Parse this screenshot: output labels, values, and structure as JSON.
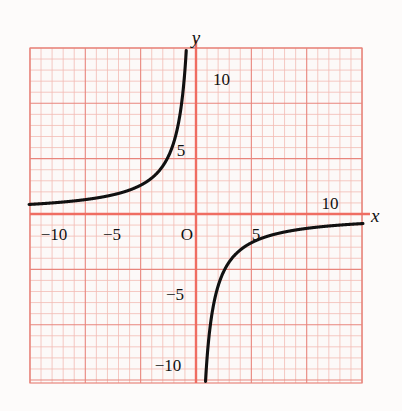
{
  "figure": {
    "background_color": "#fdfbfa",
    "plot_background_color": "#fcf9f8",
    "grid_color_minor": "#f0b5ae",
    "grid_color_major": "#e8857c",
    "axis_color": "#ef6d62",
    "curve_color": "#111111",
    "label_color": "#111111"
  },
  "axes": {
    "x_label": "x",
    "y_label": "y",
    "origin_label": "O"
  },
  "x_ticks": [
    {
      "value": -10,
      "label": "−10"
    },
    {
      "value": -5,
      "label": "−5"
    },
    {
      "value": 5,
      "label": "5"
    },
    {
      "value": 10,
      "label": "10"
    }
  ],
  "y_ticks": [
    {
      "value": 10,
      "label": "10"
    },
    {
      "value": 5,
      "label": "5"
    },
    {
      "value": -5,
      "label": "−5"
    },
    {
      "value": -10,
      "label": "−10"
    }
  ],
  "chart_data": {
    "type": "line",
    "title": "",
    "xlabel": "x",
    "ylabel": "y",
    "xlim": [
      -15,
      15
    ],
    "ylim": [
      -15.1,
      15
    ],
    "grid": true,
    "grid_minor_step": 1,
    "grid_major_step": 5,
    "legend": "none",
    "equation": "y = -13/x",
    "asymptotes": {
      "vertical": 0,
      "horizontal": 0
    },
    "series": [
      {
        "name": "y = -13/x (branch in quadrant II)",
        "x": [
          -15,
          -14,
          -13,
          -12,
          -11,
          -10,
          -9,
          -8,
          -7,
          -6,
          -5,
          -4.5,
          -4,
          -3.5,
          -3,
          -2.75,
          -2.5,
          -2.25,
          -2,
          -1.8,
          -1.6,
          -1.4,
          -1.3,
          -1.2,
          -1.1,
          -1.0,
          -0.95,
          -0.9
        ],
        "y": [
          0.867,
          0.929,
          1.0,
          1.083,
          1.182,
          1.3,
          1.444,
          1.625,
          1.857,
          2.167,
          2.6,
          2.889,
          3.25,
          3.714,
          4.333,
          4.727,
          5.2,
          5.778,
          6.5,
          7.222,
          8.125,
          9.286,
          10.0,
          10.833,
          11.818,
          13.0,
          13.684,
          14.444
        ]
      },
      {
        "name": "y = -13/x (branch in quadrant IV)",
        "x": [
          0.9,
          0.95,
          1.0,
          1.1,
          1.2,
          1.3,
          1.4,
          1.6,
          1.8,
          2.0,
          2.25,
          2.5,
          2.75,
          3.0,
          3.5,
          4.0,
          4.5,
          5.0,
          6.0,
          7.0,
          8.0,
          9.0,
          10.0,
          11.0,
          12.0,
          13.0,
          14.0,
          15.0
        ],
        "y": [
          -14.444,
          -13.684,
          -13.0,
          -11.818,
          -10.833,
          -10.0,
          -9.286,
          -8.125,
          -7.222,
          -6.5,
          -5.778,
          -5.2,
          -4.727,
          -4.333,
          -3.714,
          -3.25,
          -2.889,
          -2.6,
          -2.167,
          -1.857,
          -1.625,
          -1.444,
          -1.3,
          -1.182,
          -1.083,
          -1.0,
          -0.929,
          -0.867
        ]
      }
    ]
  }
}
